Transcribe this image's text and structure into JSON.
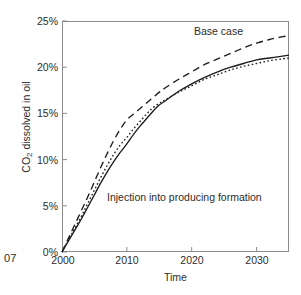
{
  "figure": {
    "page_marker": "07"
  },
  "chart_data": {
    "type": "line",
    "title": "",
    "xlabel": "Time",
    "ylabel": "CO2 dissolved in oil",
    "ylabel_parts": {
      "prefix": "CO",
      "sub": "2",
      "suffix": " dissolved in oil"
    },
    "xlim": [
      2000,
      2035
    ],
    "ylim": [
      0,
      25
    ],
    "grid": false,
    "legend": "none",
    "xticks": [
      2000,
      2010,
      2020,
      2030
    ],
    "xtick_labels": [
      "2000",
      "2010",
      "2020",
      "2030"
    ],
    "yticks": [
      0,
      5,
      10,
      15,
      20,
      25
    ],
    "ytick_labels": [
      "0%",
      "5%",
      "10%",
      "15%",
      "20%",
      "25%"
    ],
    "annotations": [
      {
        "text": "Base case",
        "x": 2027,
        "y": 24.0
      },
      {
        "text": "Injection into producing formation",
        "x": 2007,
        "y": 6.6
      }
    ],
    "series": [
      {
        "name": "Base case",
        "style": "dashed",
        "color": "#1c1c1c",
        "x": [
          2000,
          2001,
          2002,
          2003,
          2004,
          2005,
          2006,
          2007,
          2008,
          2009,
          2010,
          2011,
          2012,
          2013,
          2014,
          2015,
          2016,
          2018,
          2020,
          2022,
          2024,
          2026,
          2028,
          2030,
          2032,
          2034,
          2035
        ],
        "y": [
          0.0,
          1.5,
          3.0,
          4.5,
          6.0,
          7.6,
          9.2,
          10.7,
          12.1,
          13.3,
          14.3,
          14.9,
          15.5,
          16.1,
          16.7,
          17.3,
          17.8,
          18.7,
          19.5,
          20.3,
          20.9,
          21.5,
          22.1,
          22.6,
          23.0,
          23.3,
          23.4
        ]
      },
      {
        "name": "Dotted variant",
        "style": "dotted",
        "color": "#1c1c1c",
        "x": [
          2000,
          2001,
          2002,
          2003,
          2004,
          2005,
          2006,
          2007,
          2008,
          2009,
          2010,
          2011,
          2012,
          2013,
          2014,
          2015,
          2016,
          2018,
          2020,
          2022,
          2024,
          2026,
          2028,
          2030,
          2032,
          2034,
          2035
        ],
        "y": [
          0.0,
          1.3,
          2.6,
          3.9,
          5.3,
          6.7,
          8.1,
          9.4,
          10.6,
          11.6,
          12.4,
          13.3,
          14.1,
          14.9,
          15.6,
          16.1,
          16.5,
          17.3,
          18.0,
          18.7,
          19.2,
          19.7,
          20.1,
          20.4,
          20.7,
          20.9,
          21.0
        ]
      },
      {
        "name": "Injection into producing formation",
        "style": "solid",
        "color": "#1c1c1c",
        "x": [
          2000,
          2001,
          2002,
          2003,
          2004,
          2005,
          2006,
          2007,
          2008,
          2009,
          2010,
          2011,
          2012,
          2013,
          2014,
          2015,
          2016,
          2018,
          2020,
          2022,
          2024,
          2026,
          2028,
          2030,
          2032,
          2034,
          2035
        ],
        "y": [
          0.0,
          1.2,
          2.4,
          3.6,
          4.9,
          6.2,
          7.5,
          8.7,
          9.8,
          10.8,
          11.7,
          12.7,
          13.6,
          14.4,
          15.2,
          15.9,
          16.4,
          17.4,
          18.2,
          18.9,
          19.5,
          20.0,
          20.4,
          20.8,
          21.0,
          21.2,
          21.3
        ]
      }
    ]
  }
}
